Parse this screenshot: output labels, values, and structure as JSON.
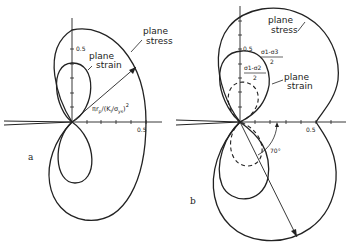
{
  "figure": {
    "panel_a": {
      "label": "a",
      "tick_label_y": "0.5",
      "tick_label_x": "0.5",
      "curve_outer_label_1": "plane",
      "curve_outer_label_2": "stress",
      "curve_inner_label_1": "plane",
      "curve_inner_label_2": "strain",
      "radius_label_main": "πr",
      "radius_label_sub": "p",
      "radius_label_rest": "/(K",
      "radius_label_sub2": "I",
      "radius_label_rest2": "/σ",
      "radius_label_sub3": "ys",
      "radius_label_close": ")",
      "radius_label_exp": "2"
    },
    "panel_b": {
      "label": "b",
      "tick_label_y": "0.5",
      "tick_label_x": "0.5",
      "curve_outer_label_1": "plane",
      "curve_outer_label_2": "stress",
      "curve_inner_label_1": "plane",
      "curve_inner_label_2": "strain",
      "frac1_num": "σ1-σ3",
      "frac1_den": "2",
      "frac2_num": "σ1-σ2",
      "frac2_den": "2",
      "angle_label": "70°"
    },
    "colors": {
      "line": "#222222",
      "background": "#ffffff"
    }
  }
}
